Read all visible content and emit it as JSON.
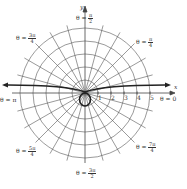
{
  "diagram": {
    "type": "polar-graph",
    "center_px": [
      85,
      93
    ],
    "unit_px": 13,
    "circles": [
      1,
      2,
      3,
      4,
      5
    ],
    "radial_step_deg": 15,
    "colors": {
      "grid": "#555555",
      "curve": "#222222",
      "axis": "#444444"
    }
  },
  "axes": {
    "x_label": "x",
    "y_label": "y"
  },
  "ticks": [
    "1",
    "2",
    "3",
    "4",
    "5"
  ],
  "angle_labels": [
    {
      "id": "theta-0",
      "prefix": "θ = ",
      "num": "0",
      "den": ""
    },
    {
      "id": "theta-pi-4",
      "prefix": "θ = ",
      "num": "π",
      "den": "4"
    },
    {
      "id": "theta-pi-2",
      "prefix": "θ = ",
      "num": "π",
      "den": "2"
    },
    {
      "id": "theta-3pi-4",
      "prefix": "θ = ",
      "num": "3π",
      "den": "4"
    },
    {
      "id": "theta-pi",
      "prefix": "θ = ",
      "num": "π",
      "den": ""
    },
    {
      "id": "theta-5pi-4",
      "prefix": "θ = ",
      "num": "5π",
      "den": "4"
    },
    {
      "id": "theta-3pi-2",
      "prefix": "θ = ",
      "num": "3π",
      "den": "2"
    },
    {
      "id": "theta-7pi-4",
      "prefix": "θ = ",
      "num": "7π",
      "den": "4"
    }
  ],
  "curve": {
    "description": "conchoid-like curve with asymptote above x-axis and small inner loop below origin"
  }
}
